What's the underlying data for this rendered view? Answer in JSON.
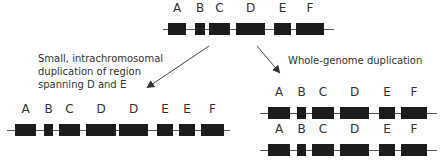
{
  "colors": {
    "gene_block": "#1c1c1c",
    "chromosome_line": "#555555",
    "text": "#333333"
  },
  "original": {
    "genes": [
      {
        "label": "A",
        "x": 5,
        "w": 18
      },
      {
        "label": "B",
        "x": 32,
        "w": 10
      },
      {
        "label": "C",
        "x": 46,
        "w": 21
      },
      {
        "label": "D",
        "x": 73,
        "w": 29
      },
      {
        "label": "E",
        "x": 111,
        "w": 17
      },
      {
        "label": "F",
        "x": 133,
        "w": 28
      }
    ]
  },
  "segmental": {
    "caption": [
      "Small, intrachromosomal",
      "duplication of region",
      "spanning D and E"
    ],
    "genes": [
      {
        "label": "A",
        "x": 8,
        "w": 21
      },
      {
        "label": "B",
        "x": 37,
        "w": 9
      },
      {
        "label": "C",
        "x": 52,
        "w": 21
      },
      {
        "label": "D",
        "x": 79,
        "w": 30
      },
      {
        "label": "D",
        "x": 112,
        "w": 29
      },
      {
        "label": "E",
        "x": 150,
        "w": 16
      },
      {
        "label": "E",
        "x": 172,
        "w": 16
      },
      {
        "label": "F",
        "x": 194,
        "w": 23
      }
    ]
  },
  "wgd": {
    "caption": "Whole-genome duplication",
    "copies": [
      {
        "genes": [
          {
            "label": "A",
            "x": 8,
            "w": 22
          },
          {
            "label": "B",
            "x": 37,
            "w": 9
          },
          {
            "label": "C",
            "x": 52,
            "w": 22
          },
          {
            "label": "D",
            "x": 80,
            "w": 29
          },
          {
            "label": "E",
            "x": 119,
            "w": 16
          },
          {
            "label": "F",
            "x": 141,
            "w": 26
          }
        ]
      },
      {
        "genes": [
          {
            "label": "A",
            "x": 8,
            "w": 22
          },
          {
            "label": "B",
            "x": 37,
            "w": 9
          },
          {
            "label": "C",
            "x": 52,
            "w": 22
          },
          {
            "label": "D",
            "x": 80,
            "w": 29
          },
          {
            "label": "E",
            "x": 119,
            "w": 16
          },
          {
            "label": "F",
            "x": 141,
            "w": 26
          }
        ]
      }
    ]
  }
}
